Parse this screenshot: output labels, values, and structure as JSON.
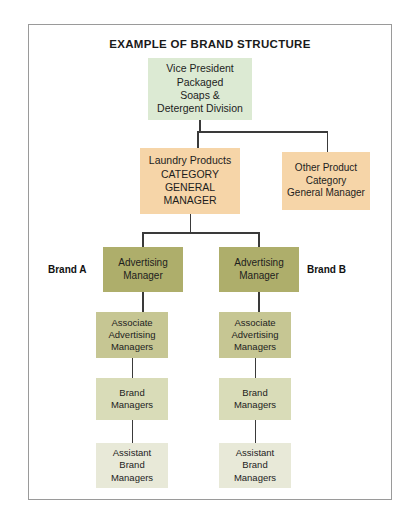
{
  "title": "EXAMPLE OF BRAND STRUCTURE",
  "colors": {
    "tier1": "#dcead3",
    "tier2": "#f6d5a8",
    "tier3": "#aeae6b",
    "tier4": "#c6c693",
    "tier5": "#d9dcb8",
    "tier6": "#e8e9d8",
    "connector": "#3a3a3a",
    "frame": "#9a9a9a"
  },
  "nodes": {
    "vice_president": {
      "lines": [
        "Vice President",
        "Packaged",
        "Soaps &",
        "Detergent Division"
      ]
    },
    "laundry_products": {
      "lines": [
        "Laundry Products",
        "CATEGORY",
        "GENERAL",
        "MANAGER"
      ]
    },
    "other_product": {
      "lines": [
        "Other Product",
        "Category",
        "General Manager"
      ]
    },
    "advertising_manager_a": {
      "lines": [
        "Advertising",
        "Manager"
      ]
    },
    "advertising_manager_b": {
      "lines": [
        "Advertising",
        "Manager"
      ]
    },
    "associate_advertising_managers_a": {
      "lines": [
        "Associate",
        "Advertising",
        "Managers"
      ]
    },
    "associate_advertising_managers_b": {
      "lines": [
        "Associate",
        "Advertising",
        "Managers"
      ]
    },
    "brand_managers_a": {
      "lines": [
        "Brand",
        "Managers"
      ]
    },
    "brand_managers_b": {
      "lines": [
        "Brand",
        "Managers"
      ]
    },
    "assistant_brand_managers_a": {
      "lines": [
        "Assistant",
        "Brand",
        "Managers"
      ]
    },
    "assistant_brand_managers_b": {
      "lines": [
        "Assistant",
        "Brand",
        "Managers"
      ]
    }
  },
  "labels": {
    "brand_a": "Brand A",
    "brand_b": "Brand B"
  }
}
